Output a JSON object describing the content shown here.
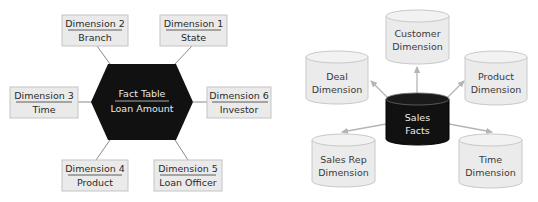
{
  "left_diagram": {
    "fact": {
      "title": "Fact Table",
      "subtitle": "Loan Amount",
      "fill": "#111111"
    },
    "dimensions": [
      {
        "id": "dim2",
        "title": "Dimension 2",
        "subtitle": "Branch"
      },
      {
        "id": "dim1",
        "title": "Dimension 1",
        "subtitle": "State"
      },
      {
        "id": "dim3",
        "title": "Dimension 3",
        "subtitle": "Time"
      },
      {
        "id": "dim6",
        "title": "Dimension 6",
        "subtitle": "Investor"
      },
      {
        "id": "dim4",
        "title": "Dimension 4",
        "subtitle": "Product"
      },
      {
        "id": "dim5",
        "title": "Dimension 5",
        "subtitle": "Loan Officer"
      }
    ],
    "box_fill": "#eaeaea",
    "box_stroke": "#c4c4c4"
  },
  "right_diagram": {
    "fact": {
      "line1": "Sales",
      "line2": "Facts",
      "fill": "#111111"
    },
    "dimensions": [
      {
        "id": "customer",
        "line1": "Customer",
        "line2": "Dimension"
      },
      {
        "id": "deal",
        "line1": "Deal",
        "line2": "Dimension"
      },
      {
        "id": "product",
        "line1": "Product",
        "line2": "Dimension"
      },
      {
        "id": "salesrep",
        "line1": "Sales Rep",
        "line2": "Dimension"
      },
      {
        "id": "time",
        "line1": "Time",
        "line2": "Dimension"
      }
    ],
    "cylinder_fill": "#ebebeb",
    "cylinder_stroke": "#c8c8c8",
    "arrow_color": "#b5b5b5"
  }
}
